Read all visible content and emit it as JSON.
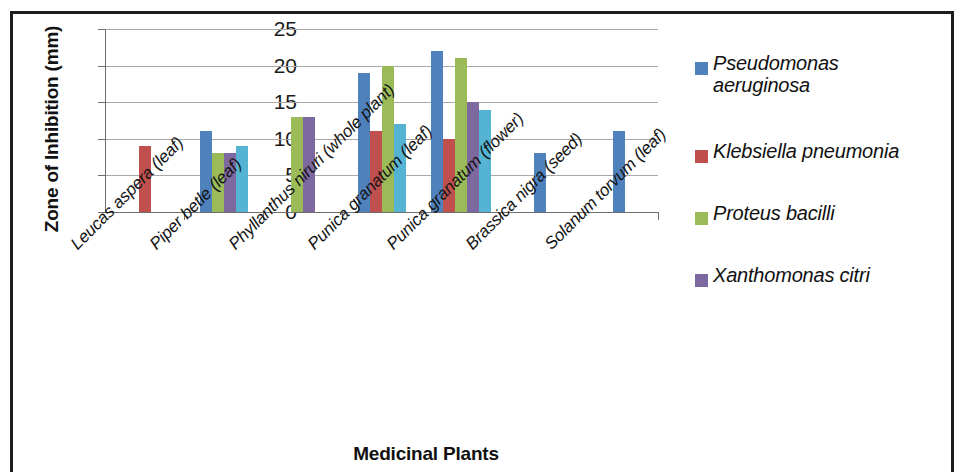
{
  "chart_data": {
    "type": "bar",
    "title": "",
    "xlabel": "Medicinal Plants",
    "ylabel": "Zone of Inhibition (mm)",
    "ylim": [
      0,
      25
    ],
    "yticks": [
      0,
      5,
      10,
      15,
      20,
      25
    ],
    "grid": true,
    "legend_position": "right",
    "categories": [
      "Leucas aspera (leaf)",
      "Piper betle (leaf)",
      "Phyllanthus niruri (whole plant)",
      "Punica granatum (leaf)",
      "Punica granatum (flower)",
      "Brassica nigra (seed)",
      "Solanum torvum (leaf)"
    ],
    "series": [
      {
        "name": "Pseudomonas aeruginosa",
        "color": "#4f81bd",
        "values": [
          0,
          11,
          0,
          19,
          22,
          8,
          11
        ]
      },
      {
        "name": "Klebsiella pneumonia",
        "color": "#c0504d",
        "values": [
          9,
          0,
          0,
          11,
          10,
          0,
          0
        ]
      },
      {
        "name": "Proteus bacilli",
        "color": "#9bbb59",
        "values": [
          0,
          8,
          13,
          20,
          21,
          0,
          0
        ]
      },
      {
        "name": "Xanthomonas citri",
        "color": "#7d699f",
        "values": [
          0,
          8,
          13,
          0,
          15,
          0,
          0
        ]
      },
      {
        "name": "",
        "color": "#55b3d4",
        "values": [
          0,
          9,
          0,
          12,
          14,
          0,
          0
        ]
      }
    ]
  },
  "axes": {
    "y_title": "Zone of Inhibition (mm)",
    "x_title": "Medicinal Plants",
    "y_tick_labels": [
      "25",
      "20",
      "15",
      "10",
      "5",
      "0"
    ]
  },
  "legend": {
    "items": [
      {
        "label": "Pseudomonas\naeruginosa",
        "line1": "Pseudomonas",
        "line2": "aeruginosa",
        "color": "#4f81bd"
      },
      {
        "label": "Klebsiella  pneumonia",
        "line1": "Klebsiella  pneumonia",
        "line2": "",
        "color": "#c0504d"
      },
      {
        "label": "Proteus  bacilli",
        "line1": "Proteus  bacilli",
        "line2": "",
        "color": "#9bbb59"
      },
      {
        "label": "Xanthomonas citri",
        "line1": "Xanthomonas citri",
        "line2": "",
        "color": "#7d699f"
      }
    ]
  },
  "x_categories": [
    "Leucas aspera (leaf)",
    "Piper betle (leaf)",
    "Phyllanthus niruri (whole plant)",
    "Punica granatum (leaf)",
    "Punica granatum (flower)",
    "Brassica nigra (seed)",
    "Solanum torvum (leaf)"
  ]
}
